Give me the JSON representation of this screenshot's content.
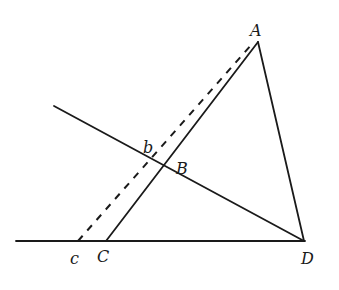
{
  "diagram": {
    "type": "geometry",
    "points": [
      {
        "id": "A",
        "label": "A",
        "x": 258,
        "y": 42
      },
      {
        "id": "B",
        "label": "B",
        "x": 163,
        "y": 166
      },
      {
        "id": "C",
        "label": "C",
        "x": 106,
        "y": 241
      },
      {
        "id": "D",
        "label": "D",
        "x": 304,
        "y": 241
      },
      {
        "id": "b",
        "label": "b",
        "x": 150,
        "y": 160
      },
      {
        "id": "c",
        "label": "c",
        "x": 78,
        "y": 241
      }
    ],
    "segments": [
      {
        "from": "baseline-left",
        "to": "D",
        "style": "solid"
      },
      {
        "from": "A",
        "to": "C",
        "style": "solid"
      },
      {
        "from": "A",
        "to": "D",
        "style": "solid"
      },
      {
        "from": "line-left-end",
        "to": "D",
        "style": "solid",
        "through": [
          "b",
          "B"
        ]
      },
      {
        "from": "c",
        "to": "near-A",
        "style": "dashed",
        "through": [
          "b"
        ]
      }
    ],
    "labels": {
      "A": "A",
      "B": "B",
      "C": "C",
      "D": "D",
      "b": "b",
      "c": "c"
    }
  }
}
